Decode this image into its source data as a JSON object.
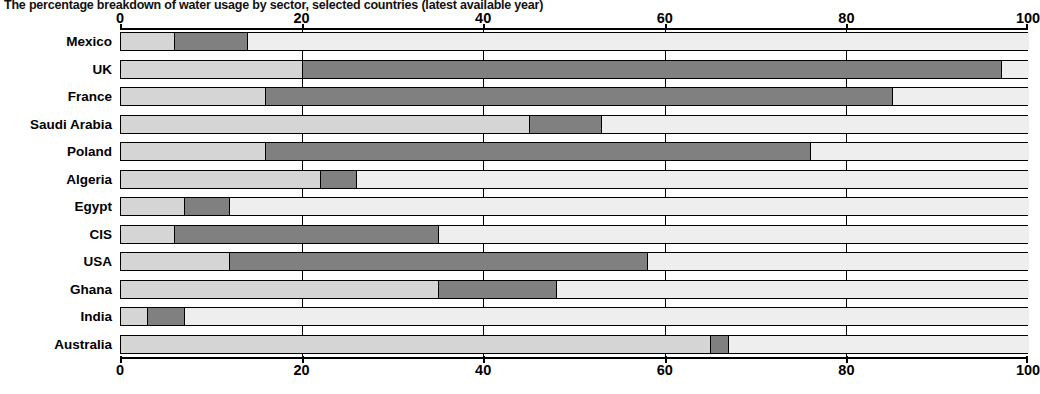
{
  "chart_data": {
    "type": "bar",
    "orientation": "horizontal",
    "stacked": true,
    "title": "The percentage breakdown of water usage by sector, selected countries (latest available year)",
    "xlabel": "",
    "ylabel": "",
    "xlim": [
      0,
      100
    ],
    "grid": true,
    "legend_position": "none",
    "axis_ticks": [
      "0",
      "20",
      "40",
      "60",
      "80",
      "100"
    ],
    "axis_tick_values": [
      0,
      20,
      40,
      60,
      80,
      100
    ],
    "categories": [
      "Mexico",
      "UK",
      "France",
      "Saudi Arabia",
      "Poland",
      "Algeria",
      "Egypt",
      "CIS",
      "USA",
      "Ghana",
      "India",
      "Australia"
    ],
    "series": [
      {
        "name": "Domestic",
        "color": "#d5d5d5",
        "values": [
          6,
          20,
          16,
          45,
          16,
          22,
          7,
          6,
          12,
          35,
          3,
          65
        ]
      },
      {
        "name": "Industry",
        "color": "#808080",
        "values": [
          8,
          77,
          69,
          8,
          60,
          4,
          5,
          29,
          46,
          13,
          4,
          2
        ]
      },
      {
        "name": "Agriculture",
        "color": "#eeeeee",
        "values": [
          86,
          3,
          15,
          47,
          24,
          74,
          88,
          65,
          42,
          52,
          93,
          33
        ]
      }
    ],
    "segment_boundaries": [
      {
        "country": "Mexico",
        "domestic_end": 6,
        "industry_end": 14
      },
      {
        "country": "UK",
        "domestic_end": 20,
        "industry_end": 97
      },
      {
        "country": "France",
        "domestic_end": 16,
        "industry_end": 85
      },
      {
        "country": "Saudi Arabia",
        "domestic_end": 45,
        "industry_end": 53
      },
      {
        "country": "Poland",
        "domestic_end": 16,
        "industry_end": 76
      },
      {
        "country": "Algeria",
        "domestic_end": 22,
        "industry_end": 26
      },
      {
        "country": "Egypt",
        "domestic_end": 7,
        "industry_end": 12
      },
      {
        "country": "CIS",
        "domestic_end": 6,
        "industry_end": 35
      },
      {
        "country": "USA",
        "domestic_end": 12,
        "industry_end": 58
      },
      {
        "country": "Ghana",
        "domestic_end": 35,
        "industry_end": 48
      },
      {
        "country": "India",
        "domestic_end": 3,
        "industry_end": 7
      },
      {
        "country": "Australia",
        "domestic_end": 65,
        "industry_end": 67
      }
    ]
  }
}
